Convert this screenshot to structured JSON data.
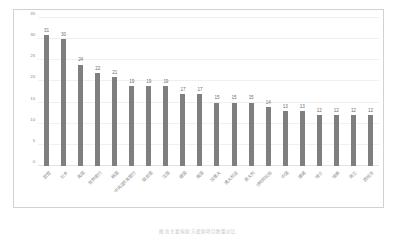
{
  "chart_data": {
    "type": "bar",
    "title": "",
    "subtitle": "",
    "xlabel": "",
    "ylabel": "",
    "ylim": [
      0,
      35
    ],
    "ytick_values": [
      0,
      5,
      10,
      15,
      20,
      25,
      30,
      35
    ],
    "ytick_labels": [
      "0",
      "5",
      "10",
      "15",
      "20",
      "25",
      "30",
      "35"
    ],
    "grid": true,
    "grid_axis": "y",
    "legend": false,
    "legend_position": "none",
    "bar_color": "#7f7f7f",
    "orientation": "vertical",
    "categories": [
      "欧盟",
      "日本",
      "美国",
      "世界银行",
      "韩国",
      "中央亚开发银行",
      "联合国",
      "法国",
      "德国",
      "英国",
      "加拿大",
      "澳大利亚",
      "意大利",
      "沙特阿拉伯",
      "中国",
      "挪威",
      "瑞士",
      "瑞典",
      "荷兰",
      "西班牙"
    ],
    "values": [
      31,
      30,
      24,
      22,
      21,
      19,
      19,
      19,
      17,
      17,
      15,
      15,
      15,
      14,
      13,
      13,
      12,
      12,
      12,
      12
    ],
    "data_labels": [
      "31",
      "30",
      "24",
      "22",
      "21",
      "19",
      "19",
      "19",
      "17",
      "17",
      "15",
      "15",
      "15",
      "14",
      "13",
      "13",
      "12",
      "12",
      "12",
      "12"
    ]
  },
  "caption": {
    "text": "图 各主要捐助方援助项目数量对比"
  }
}
